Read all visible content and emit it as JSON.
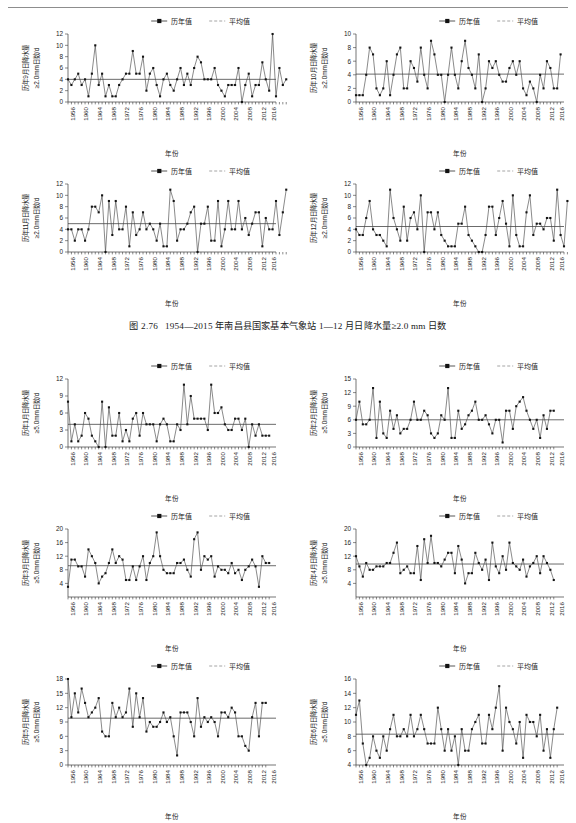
{
  "caption": {
    "number": "图 2.76",
    "text": "1954—2015 年南昌县国家基本气象站 1—12 月日降水量≥2.0 mm 日数"
  },
  "legend": {
    "series_label": "历年值",
    "mean_label": "平均值"
  },
  "axis": {
    "xlabel": "年份",
    "xticks": [
      "1956",
      "1960",
      "1964",
      "1968",
      "1972",
      "1976",
      "1980",
      "1984",
      "1988",
      "1992",
      "1996",
      "2000",
      "2004",
      "2008",
      "2012",
      "2016"
    ]
  },
  "chart_data": [
    {
      "id": "sep-2mm",
      "type": "line",
      "title": "",
      "ylabel": "历年9月日降水量",
      "ylabel2": "≥2.0mm日数/d",
      "xlabel": "年份",
      "ylim": [
        0,
        12
      ],
      "yticks": [
        0,
        2,
        4,
        6,
        8,
        10,
        12
      ],
      "grid": false,
      "legend": [
        "历年值",
        "平均值"
      ],
      "mean": 4.0,
      "x_start": 1954,
      "x_end": 2015,
      "values": [
        4,
        3,
        4,
        5,
        3,
        4,
        1,
        5,
        10,
        3,
        5,
        1,
        3,
        1,
        1,
        3,
        4,
        5,
        5,
        9,
        5,
        5,
        8,
        2,
        5,
        6,
        3,
        1,
        4,
        5,
        3,
        2,
        4,
        6,
        3,
        5,
        3,
        6,
        8,
        7,
        4,
        4,
        4,
        6,
        3,
        2,
        1,
        3,
        3,
        3,
        6,
        0,
        3,
        5,
        1,
        3,
        3,
        7,
        4,
        2,
        12,
        1,
        6,
        3,
        4
      ]
    },
    {
      "id": "oct-2mm",
      "type": "line",
      "title": "",
      "ylabel": "历年10月日降水量",
      "ylabel2": "≥2.0mm日数/d",
      "xlabel": "年份",
      "ylim": [
        0,
        10
      ],
      "yticks": [
        0,
        2,
        4,
        6,
        8,
        10
      ],
      "grid": false,
      "legend": [
        "历年值",
        "平均值"
      ],
      "mean": 4.1,
      "x_start": 1954,
      "x_end": 2015,
      "values": [
        1,
        1,
        1,
        4,
        8,
        7,
        2,
        1,
        2,
        6,
        1,
        4,
        7,
        8,
        2,
        2,
        6,
        5,
        3,
        8,
        4,
        2,
        9,
        7,
        4,
        4,
        0,
        4,
        8,
        4,
        2,
        6,
        9,
        5,
        4,
        2,
        7,
        0,
        2,
        6,
        5,
        6,
        4,
        3,
        3,
        5,
        6,
        4,
        6,
        2,
        1,
        3,
        2,
        0,
        4,
        2,
        6,
        5,
        2,
        2,
        7
      ]
    },
    {
      "id": "nov-2mm",
      "type": "line",
      "title": "",
      "ylabel": "历年11月日降水量",
      "ylabel2": "≥2.0mm日数/d",
      "xlabel": "年份",
      "ylim": [
        0,
        12
      ],
      "yticks": [
        0,
        2,
        4,
        6,
        8,
        10,
        12
      ],
      "grid": false,
      "legend": [
        "历年值",
        "平均值"
      ],
      "mean": 5.0,
      "x_start": 1954,
      "x_end": 2015,
      "values": [
        4,
        4,
        2,
        4,
        4,
        2,
        4,
        8,
        8,
        7,
        10,
        0,
        9,
        3,
        9,
        4,
        4,
        8,
        1,
        7,
        3,
        4,
        7,
        4,
        5,
        4,
        2,
        5,
        1,
        1,
        11,
        9,
        2,
        4,
        4,
        5,
        7,
        8,
        0,
        5,
        5,
        8,
        2,
        2,
        9,
        1,
        4,
        9,
        4,
        4,
        9,
        4,
        6,
        3,
        5,
        7,
        7,
        1,
        6,
        4,
        4,
        9,
        3,
        7,
        11
      ]
    },
    {
      "id": "dec-2mm",
      "type": "line",
      "title": "",
      "ylabel": "历年12月日降水量",
      "ylabel2": "≥2.0mm日数/d",
      "xlabel": "年份",
      "ylim": [
        0,
        12
      ],
      "yticks": [
        0,
        2,
        4,
        6,
        8,
        10,
        12
      ],
      "grid": false,
      "legend": [
        "历年值",
        "平均值"
      ],
      "mean": 4.5,
      "x_start": 1954,
      "x_end": 2015,
      "values": [
        4,
        3,
        3,
        6,
        9,
        4,
        3,
        3,
        2,
        1,
        11,
        6,
        4,
        2,
        8,
        2,
        6,
        7,
        4,
        10,
        0,
        7,
        7,
        4,
        7,
        3,
        2,
        1,
        1,
        1,
        5,
        5,
        8,
        3,
        2,
        1,
        0,
        0,
        3,
        8,
        8,
        3,
        6,
        9,
        5,
        1,
        10,
        3,
        1,
        1,
        7,
        10,
        3,
        5,
        5,
        4,
        6,
        6,
        2,
        11,
        3,
        1,
        9
      ]
    },
    {
      "id": "jan-5mm",
      "type": "line",
      "title": "",
      "ylabel": "历年1月日降水量",
      "ylabel2": "≥5.0mm日数/d",
      "xlabel": "年份",
      "ylim": [
        0,
        12
      ],
      "yticks": [
        0,
        3,
        6,
        9,
        12
      ],
      "grid": false,
      "legend": [
        "历年值",
        "平均值"
      ],
      "mean": 4.0,
      "x_start": 1954,
      "x_end": 2015,
      "values": [
        8,
        1,
        4,
        1,
        2,
        6,
        5,
        2,
        1,
        0,
        8,
        0,
        7,
        2,
        2,
        6,
        1,
        3,
        1,
        5,
        6,
        2,
        6,
        4,
        4,
        4,
        1,
        4,
        5,
        4,
        1,
        1,
        4,
        3,
        11,
        4,
        9,
        5,
        5,
        5,
        5,
        3,
        11,
        6,
        6,
        7,
        4,
        3,
        3,
        5,
        5,
        3,
        5,
        0,
        4,
        2,
        4,
        2,
        2,
        2
      ]
    },
    {
      "id": "feb-5mm",
      "type": "line",
      "title": "",
      "ylabel": "历年2月日降水量",
      "ylabel2": "≥5.0mm日数/d",
      "xlabel": "年份",
      "ylim": [
        0,
        15
      ],
      "yticks": [
        0,
        3,
        6,
        9,
        12,
        15
      ],
      "grid": false,
      "legend": [
        "历年值",
        "平均值"
      ],
      "mean": 6.0,
      "x_start": 1954,
      "x_end": 2015,
      "values": [
        6,
        10,
        5,
        5,
        6,
        13,
        2,
        10,
        3,
        2,
        8,
        4,
        7,
        3,
        4,
        4,
        6,
        10,
        6,
        6,
        8,
        7,
        3,
        2,
        3,
        7,
        6,
        13,
        2,
        2,
        8,
        4,
        5,
        7,
        8,
        10,
        6,
        6,
        7,
        5,
        3,
        6,
        6,
        1,
        8,
        8,
        4,
        9,
        10,
        11,
        8,
        6,
        4,
        6,
        2,
        7,
        4,
        8,
        8
      ]
    },
    {
      "id": "mar-5mm",
      "type": "line",
      "title": "",
      "ylabel": "历年3月日降水量",
      "ylabel2": "≥5.0mm日数/d",
      "xlabel": "年份",
      "ylim": [
        0,
        20
      ],
      "yticks": [
        4,
        8,
        12,
        16,
        20
      ],
      "grid": false,
      "legend": [
        "历年值",
        "平均值"
      ],
      "mean": 9.2,
      "x_start": 1954,
      "x_end": 2015,
      "values": [
        3,
        11,
        11,
        9,
        9,
        6,
        14,
        12,
        10,
        4,
        6,
        7,
        10,
        14,
        10,
        12,
        11,
        5,
        5,
        9,
        5,
        9,
        12,
        5,
        10,
        12,
        19,
        12,
        8,
        7,
        7,
        7,
        10,
        10,
        11,
        8,
        6,
        17,
        19,
        8,
        12,
        11,
        12,
        6,
        9,
        8,
        8,
        7,
        10,
        7,
        8,
        5,
        8,
        9,
        11,
        9,
        3,
        12,
        10,
        10
      ]
    },
    {
      "id": "apr-5mm",
      "type": "line",
      "title": "",
      "ylabel": "历年4月日降水量",
      "ylabel2": "≥5.0mm日数/d",
      "xlabel": "年份",
      "ylim": [
        0,
        20
      ],
      "yticks": [
        4,
        8,
        12,
        16,
        20
      ],
      "grid": false,
      "legend": [
        "历年值",
        "平均值"
      ],
      "mean": 9.7,
      "x_start": 1954,
      "x_end": 2015,
      "values": [
        12,
        9,
        6,
        10,
        8,
        8,
        9,
        9,
        9,
        10,
        10,
        13,
        16,
        7,
        8,
        9,
        7,
        7,
        15,
        5,
        17,
        10,
        18,
        10,
        10,
        9,
        11,
        13,
        13,
        7,
        15,
        11,
        4,
        7,
        7,
        13,
        10,
        8,
        11,
        5,
        16,
        9,
        7,
        12,
        8,
        16,
        10,
        9,
        8,
        11,
        6,
        9,
        10,
        12,
        7,
        12,
        10,
        8,
        5
      ]
    },
    {
      "id": "may-5mm",
      "type": "line",
      "title": "",
      "ylabel": "历年5月日降水量",
      "ylabel2": "≥5.0mm日数/d",
      "xlabel": "年份",
      "ylim": [
        0,
        18
      ],
      "yticks": [
        0,
        3,
        6,
        9,
        12,
        15,
        18
      ],
      "grid": false,
      "legend": [
        "历年值",
        "平均值"
      ],
      "mean": 9.8,
      "x_start": 1954,
      "x_end": 2015,
      "values": [
        18,
        10,
        15,
        11,
        16,
        13,
        10,
        11,
        12,
        14,
        7,
        6,
        6,
        13,
        10,
        12,
        10,
        11,
        16,
        8,
        15,
        10,
        14,
        7,
        9,
        8,
        8,
        9,
        11,
        9,
        10,
        6,
        2,
        11,
        11,
        11,
        9,
        6,
        14,
        8,
        10,
        9,
        10,
        9,
        6,
        11,
        11,
        10,
        12,
        11,
        6,
        6,
        4,
        3,
        10,
        13,
        6,
        13,
        13
      ]
    },
    {
      "id": "jun-5mm",
      "type": "line",
      "title": "",
      "ylabel": "历年6月日降水量",
      "ylabel2": "≥5.0mm日数/d",
      "xlabel": "年份",
      "ylim": [
        4,
        16
      ],
      "yticks": [
        4,
        6,
        8,
        10,
        12,
        14,
        16
      ],
      "grid": false,
      "legend": [
        "历年值",
        "平均值"
      ],
      "mean": 8.3,
      "x_start": 1954,
      "x_end": 2015,
      "values": [
        11,
        13,
        7,
        4,
        5,
        8,
        6,
        5,
        8,
        6,
        9,
        11,
        8,
        8,
        9,
        8,
        11,
        8,
        9,
        11,
        9,
        7,
        7,
        7,
        12,
        9,
        6,
        9,
        6,
        8,
        4,
        9,
        6,
        6,
        9,
        10,
        11,
        7,
        7,
        11,
        9,
        12,
        15,
        6,
        12,
        10,
        9,
        7,
        10,
        5,
        11,
        10,
        10,
        8,
        11,
        6,
        9,
        5,
        9,
        12
      ]
    }
  ]
}
